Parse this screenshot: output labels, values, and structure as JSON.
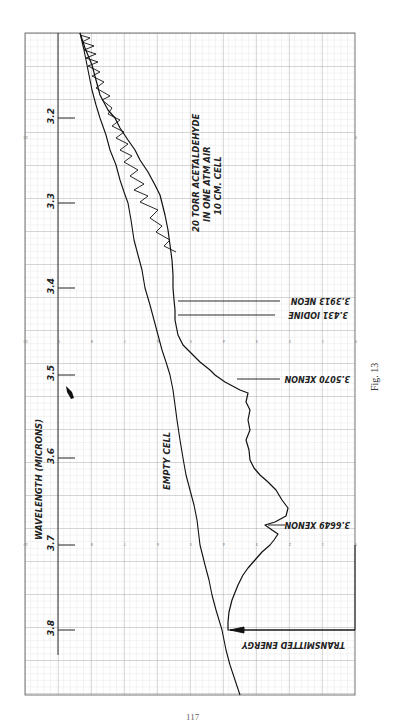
{
  "figure": {
    "caption": "Fig. 13",
    "page_number": "117"
  },
  "chart_data": {
    "type": "line",
    "title": "",
    "orientation": "rotated 90° (wavelength runs vertically, energy scale horizontally reading right-to-left)",
    "xlabel": "WAVELENGTH (MICRONS)",
    "ylabel": "TRANSMITTED ENERGY",
    "wavelength_ticks": [
      "3.2",
      "3.3",
      "3.4",
      "3.5",
      "3.6",
      "3.7",
      "3.8"
    ],
    "energy_ticks": [
      "10",
      "9",
      "8",
      "7",
      "6",
      "5",
      "4",
      "3",
      "2",
      "1",
      "0"
    ],
    "xlim": [
      3.1,
      3.88
    ],
    "ylim": [
      0,
      10
    ],
    "grid": true,
    "annotations": [
      {
        "text": "20 TORR ACETALDEHYDE",
        "line": 1
      },
      {
        "text": "IN ONE ATM AIR",
        "line": 2
      },
      {
        "text": "10 CM. CELL",
        "line": 3
      },
      {
        "text": "EMPTY CELL"
      },
      {
        "text": "3.3913 NEON",
        "wavelength": 3.3913
      },
      {
        "text": "3.431 IODINE",
        "wavelength": 3.431
      },
      {
        "text": "3.5070 XENON",
        "wavelength": 3.507
      },
      {
        "text": "3.6649 XENON",
        "wavelength": 3.6649
      },
      {
        "text": "TRANSMITTED ENERGY",
        "wavelength": 3.8
      }
    ],
    "x": [
      3.1,
      3.2,
      3.3,
      3.4,
      3.45,
      3.5,
      3.52,
      3.54,
      3.6,
      3.65,
      3.66,
      3.67,
      3.7,
      3.74,
      3.79,
      3.8,
      3.88
    ],
    "series": [
      {
        "name": "EMPTY CELL",
        "values": [
          8.3,
          7.7,
          6.9,
          6.4,
          6.2,
          5.6,
          5.5,
          5.4,
          5.2,
          5.0,
          5.0,
          4.9,
          4.7,
          4.4,
          4.1,
          4.0,
          3.5
        ]
      },
      {
        "name": "20 TORR ACETALDEHYDE IN ONE ATM AIR, 10 CM. CELL",
        "values": [
          8.3,
          7.3,
          5.8,
          5.5,
          5.4,
          4.2,
          3.2,
          3.2,
          3.1,
          2.2,
          2.0,
          2.7,
          2.6,
          3.3,
          3.8,
          3.8,
          null
        ]
      }
    ]
  },
  "plot": {
    "grid_left": 25,
    "grid_right": 355,
    "grid_top": 33,
    "grid_bottom": 695,
    "axis_x": 58,
    "wavelength_tick_y": [
      118,
      203,
      288,
      375,
      458,
      545,
      630
    ],
    "energy_scale_rows_y": [
      138,
      342,
      545
    ],
    "colors": {
      "ink": "#1a1a1a",
      "grid_minor": "#c8c8c8",
      "grid_major": "#8a8a8a",
      "paper": "#ffffff"
    },
    "empty_cell_path": "M80,33 L84,50 L88,70 L92,90 L96,105 L100,118 L106,135 L110,150 L116,165 L120,180 L124,192 L128,203 L131,220 L134,240 L138,255 L142,270 L145,288 L150,305 L154,320 L158,335 L162,350 L166,362 L170,375 L173,390 L175,405 L177,420 L180,440 L183,458 L186,475 L190,490 L194,505 L197,520 L200,545 L205,565 L209,580 L212,595 L216,610 L222,630 L226,650 L230,665 L235,680 L240,695",
    "acetaldehyde_path": "M80,33 L85,48 L92,65 L96,80 L100,95 L108,110 L115,118 L120,128 L128,140 L135,150 L140,160 L148,172 L155,185 L160,195 L162,203 L165,215 L168,230 L170,245 L172,260 L173,275 L173,288 L174,300 L175,310 L175,320 L178,335 L183,345 L190,352 L200,362 L210,370 L215,375 L225,382 L240,390 L248,393 L246,402 L250,410 L248,420 L250,430 L246,440 L249,450 L250,460 L254,468 L260,475 L268,482 L276,490 L282,500 L288,508 L286,516 L275,522 L265,525 L272,530 L278,534 L274,540 L270,545 L262,552 L255,560 L248,568 L243,575 L238,585 L232,600 L229,612 L228,622 L228,630 L290,630 L355,630",
    "neon_label": {
      "y": 305,
      "x1": 178,
      "x2": 280
    },
    "iodine_label": {
      "y": 323,
      "x1": 178,
      "x2": 275
    },
    "xenon1_label": {
      "y": 380,
      "x1": 237,
      "x2": 280
    },
    "xenon2_label": {
      "y": 525,
      "x1": 268,
      "x2": 285
    },
    "transmitted_arrow": {
      "y": 630,
      "x1": 230,
      "x2": 355
    }
  }
}
